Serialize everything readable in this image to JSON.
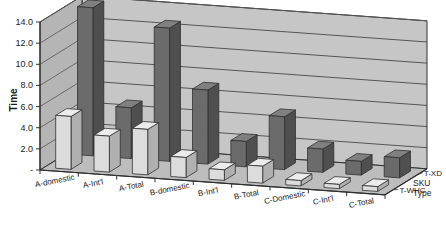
{
  "chart_data": {
    "type": "bar",
    "title": "",
    "subtitle": "",
    "xlabel": "",
    "ylabel": "Time",
    "zlabel": "SKU Type",
    "ylim": [
      0,
      14.0
    ],
    "ytick_labels": [
      "-",
      "2.0",
      "4.0",
      "6.0",
      "8.0",
      "10.0",
      "12.0",
      "14.0"
    ],
    "ytick_values": [
      0,
      2,
      4,
      6,
      8,
      10,
      12,
      14
    ],
    "grid": true,
    "legend_position": "depth-axis-right",
    "projection": "3d",
    "categories": [
      "A-domestic",
      "A-Int'l",
      "A-Total",
      "B-domestic",
      "B-Int'l",
      "B-Total",
      "C-Domestic",
      "C-Int'l",
      "C-Total"
    ],
    "series": [
      {
        "name": "T-XD",
        "color": "#6b6b6b",
        "values": [
          14.0,
          4.8,
          12.6,
          7.0,
          2.4,
          5.0,
          2.2,
          1.3,
          1.9
        ]
      },
      {
        "name": "T-WHC",
        "color": "#d8d8d8",
        "values": [
          5.0,
          3.4,
          4.3,
          1.9,
          1.0,
          1.6,
          0.5,
          0.4,
          0.45
        ]
      }
    ]
  },
  "axes": {
    "value_axis_title": "Time",
    "depth_axis_title_line1": "SKU",
    "depth_axis_title_line2": "Type"
  },
  "colors": {
    "wall_back": "#c6c6c6",
    "wall_side": "#b5b5b5",
    "floor": "#bdbdbd",
    "gridline": "#555555",
    "bar_dark_front": "#6b6b6b",
    "bar_dark_side": "#4f4f4f",
    "bar_dark_top": "#808080",
    "bar_light_front": "#dcdcdc",
    "bar_light_side": "#b0b0b0",
    "bar_light_top": "#ececec",
    "outline": "#303030",
    "text": "#1a1a1a",
    "background": "#ffffff"
  }
}
